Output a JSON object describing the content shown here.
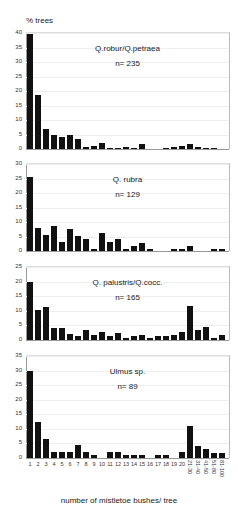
{
  "chart_data": {
    "type": "bar",
    "ylabel": "% trees",
    "xlabel": "number of mistletoe bushes/ tree",
    "categories": [
      "1",
      "2",
      "3",
      "4",
      "5",
      "6",
      "7",
      "8",
      "9",
      "10",
      "11",
      "12",
      "13",
      "14",
      "15",
      "16",
      "17",
      "18",
      "19",
      "20",
      "21-30",
      "31-40",
      "41-50",
      "51-80",
      "81-100"
    ],
    "panels": [
      {
        "title": "Q.robur/Q.petraea",
        "n_label": "n= 235",
        "ylim": [
          0,
          40
        ],
        "yticks": [
          0,
          5,
          10,
          15,
          20,
          25,
          30,
          35,
          40
        ],
        "values": [
          39.5,
          18.5,
          7,
          5,
          4,
          5,
          3.5,
          0.8,
          1.2,
          2,
          0.4,
          0.4,
          0.6,
          0.4,
          1.8,
          0,
          0,
          0.3,
          0.8,
          1.2,
          1.6,
          0.8,
          0.5,
          0.5,
          0
        ]
      },
      {
        "title": "Q. rubra",
        "n_label": "n= 129",
        "ylim": [
          0,
          30
        ],
        "yticks": [
          0,
          5,
          10,
          15,
          20,
          25,
          30
        ],
        "values": [
          25.5,
          7.8,
          5.4,
          8.5,
          3.2,
          7.6,
          5.3,
          4.2,
          0.8,
          6.2,
          3,
          4.1,
          0.8,
          1.7,
          2.9,
          0.6,
          0,
          0,
          0.6,
          0.6,
          1.6,
          0,
          0,
          0.8,
          0.8
        ]
      },
      {
        "title": "Q. palustris/Q.cocc.",
        "n_label": "n= 165",
        "ylim": [
          0,
          25
        ],
        "yticks": [
          0,
          5,
          10,
          15,
          20,
          25
        ],
        "values": [
          20,
          10.2,
          11.4,
          4.1,
          4.1,
          2.2,
          1.2,
          3.4,
          1.8,
          2.9,
          1.2,
          2.3,
          0.6,
          1.2,
          1.8,
          0.6,
          1.2,
          1.2,
          1.8,
          2.8,
          11.8,
          3.4,
          4.6,
          0.6,
          1.6
        ]
      },
      {
        "title": "Ulmus sp.",
        "n_label": "n= 89",
        "ylim": [
          0,
          35
        ],
        "yticks": [
          0,
          5,
          10,
          15,
          20,
          25,
          30,
          35
        ],
        "values": [
          30,
          12.5,
          6.5,
          2,
          2,
          2,
          4.3,
          2,
          1,
          0,
          2,
          2,
          1,
          1,
          1,
          0,
          1,
          1,
          0,
          2,
          11,
          4.2,
          3,
          1.6,
          1.6
        ]
      }
    ]
  }
}
